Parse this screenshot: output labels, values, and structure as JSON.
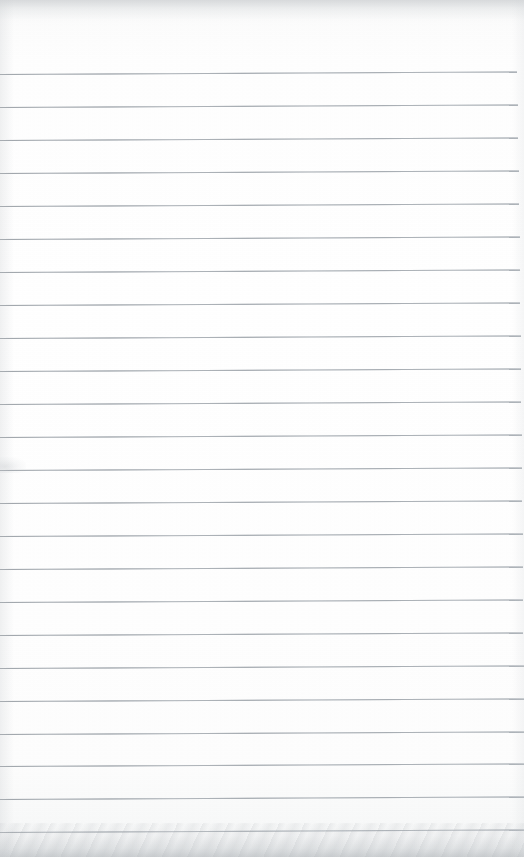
{
  "document": {
    "kind": "scanned-lined-notebook-page",
    "title": "Blank Ruled Notebook Page",
    "page_width": 524,
    "page_height": 857,
    "content_text": "",
    "has_handwriting": false,
    "has_printed_text": false,
    "paper_color": "#fdfdfd",
    "rule_color": "#b9bec3",
    "edge_shadow_color": "#b2b6ba"
  },
  "ruling": {
    "style": "wide-ruled horizontal lines",
    "line_count": 24,
    "first_line_y": 74,
    "line_spacing": 33,
    "line_thickness": 1,
    "line_start_x": 0,
    "line_end_x": 517,
    "skew_degrees": -0.28,
    "has_margin_rule": false,
    "lines": [
      {
        "index": 1,
        "y": 74,
        "x1": 0,
        "x2": 517,
        "text": ""
      },
      {
        "index": 2,
        "y": 107,
        "x1": 0,
        "x2": 518,
        "text": ""
      },
      {
        "index": 3,
        "y": 140,
        "x1": 0,
        "x2": 518,
        "text": ""
      },
      {
        "index": 4,
        "y": 173,
        "x1": 0,
        "x2": 519,
        "text": ""
      },
      {
        "index": 5,
        "y": 206,
        "x1": 0,
        "x2": 519,
        "text": ""
      },
      {
        "index": 6,
        "y": 239,
        "x1": 0,
        "x2": 520,
        "text": ""
      },
      {
        "index": 7,
        "y": 272,
        "x1": 0,
        "x2": 520,
        "text": ""
      },
      {
        "index": 8,
        "y": 305,
        "x1": 0,
        "x2": 520,
        "text": ""
      },
      {
        "index": 9,
        "y": 338,
        "x1": 0,
        "x2": 521,
        "text": ""
      },
      {
        "index": 10,
        "y": 371,
        "x1": 0,
        "x2": 521,
        "text": ""
      },
      {
        "index": 11,
        "y": 404,
        "x1": 0,
        "x2": 521,
        "text": ""
      },
      {
        "index": 12,
        "y": 437,
        "x1": 0,
        "x2": 522,
        "text": ""
      },
      {
        "index": 13,
        "y": 470,
        "x1": 0,
        "x2": 522,
        "text": ""
      },
      {
        "index": 14,
        "y": 503,
        "x1": 0,
        "x2": 522,
        "text": ""
      },
      {
        "index": 15,
        "y": 536,
        "x1": 0,
        "x2": 523,
        "text": ""
      },
      {
        "index": 16,
        "y": 569,
        "x1": 0,
        "x2": 523,
        "text": ""
      },
      {
        "index": 17,
        "y": 602,
        "x1": 0,
        "x2": 523,
        "text": ""
      },
      {
        "index": 18,
        "y": 635,
        "x1": 0,
        "x2": 523,
        "text": ""
      },
      {
        "index": 19,
        "y": 668,
        "x1": 0,
        "x2": 524,
        "text": ""
      },
      {
        "index": 20,
        "y": 701,
        "x1": 0,
        "x2": 524,
        "text": ""
      },
      {
        "index": 21,
        "y": 734,
        "x1": 0,
        "x2": 524,
        "text": ""
      },
      {
        "index": 22,
        "y": 766,
        "x1": 0,
        "x2": 524,
        "text": ""
      },
      {
        "index": 23,
        "y": 799,
        "x1": 0,
        "x2": 524,
        "text": ""
      },
      {
        "index": 24,
        "y": 832,
        "x1": 0,
        "x2": 524,
        "text": ""
      }
    ]
  },
  "artifacts": {
    "top_edge_band": {
      "y": 0,
      "height": 26
    },
    "bottom_edge_band": {
      "y": 823,
      "height": 34
    },
    "smudge": {
      "x": 0,
      "y": 457,
      "width": 26,
      "height": 16
    }
  }
}
